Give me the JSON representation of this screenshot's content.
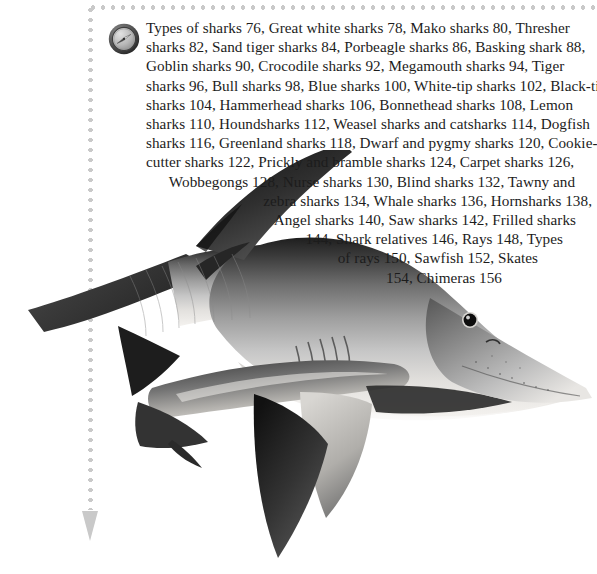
{
  "page": {
    "background_color": "#ffffff",
    "width": 597,
    "height": 574
  },
  "decor": {
    "dot_color": "#c9c9c9",
    "arrow_icon": "down-arrow-icon",
    "compass_icon": "compass-icon",
    "compass_outer_color": "#4a4a4a",
    "compass_face_color": "#bdbdbd"
  },
  "artwork": {
    "name": "shark-photograph",
    "subject": "blue shark",
    "palette": {
      "dark": "#2b2b2b",
      "mid": "#6e6e6e",
      "light": "#c8c8c8",
      "belly": "#eceae6",
      "eye": "#111111"
    }
  },
  "toc": {
    "title": "Types of sharks",
    "lines": [
      "Types of sharks 76, Great white sharks 78, Mako sharks 80, Thresher",
      "sharks 82, Sand tiger sharks 84, Porbeagle sharks 86, Basking shark 88,",
      "Goblin sharks 90, Crocodile sharks 92, Megamouth sharks 94, Tiger",
      "sharks 96, Bull sharks 98, Blue sharks 100, White-tip sharks 102, Black-tip",
      "sharks 104, Hammerhead sharks 106, Bonnethead sharks 108, Lemon",
      "sharks 110, Houndsharks 112, Weasel sharks and catsharks 114, Dogfish",
      "sharks 116, Greenland sharks 118, Dwarf and pygmy sharks 120, Cookie-",
      "cutter sharks 122, Prickly and bramble sharks 124, Carpet sharks 126,",
      "Wobbegongs 128, Nurse sharks 130, Blind sharks 132, Tawny and",
      "zebra sharks 134, Whale sharks 136, Hornsharks 138,",
      "Angel sharks 140, Saw sharks 142, Frilled sharks",
      "144, Shark relatives 146, Rays 148, Types",
      "of rays 150, Sawfish 152, Skates",
      "154, Chimeras 156"
    ],
    "entries": [
      {
        "label": "Types of sharks",
        "page": "76"
      },
      {
        "label": "Great white sharks",
        "page": "78"
      },
      {
        "label": "Mako sharks",
        "page": "80"
      },
      {
        "label": "Thresher sharks",
        "page": "82"
      },
      {
        "label": "Sand tiger sharks",
        "page": "84"
      },
      {
        "label": "Porbeagle sharks",
        "page": "86"
      },
      {
        "label": "Basking shark",
        "page": "88"
      },
      {
        "label": "Goblin sharks",
        "page": "90"
      },
      {
        "label": "Crocodile sharks",
        "page": "92"
      },
      {
        "label": "Megamouth sharks",
        "page": "94"
      },
      {
        "label": "Tiger sharks",
        "page": "96"
      },
      {
        "label": "Bull sharks",
        "page": "98"
      },
      {
        "label": "Blue sharks",
        "page": "100"
      },
      {
        "label": "White-tip sharks",
        "page": "102"
      },
      {
        "label": "Black-tip sharks",
        "page": "104"
      },
      {
        "label": "Hammerhead sharks",
        "page": "106"
      },
      {
        "label": "Bonnethead sharks",
        "page": "108"
      },
      {
        "label": "Lemon sharks",
        "page": "110"
      },
      {
        "label": "Houndsharks",
        "page": "112"
      },
      {
        "label": "Weasel sharks and catsharks",
        "page": "114"
      },
      {
        "label": "Dogfish sharks",
        "page": "116"
      },
      {
        "label": "Greenland sharks",
        "page": "118"
      },
      {
        "label": "Dwarf and pygmy sharks",
        "page": "120"
      },
      {
        "label": "Cookie-cutter sharks",
        "page": "122"
      },
      {
        "label": "Prickly and bramble sharks",
        "page": "124"
      },
      {
        "label": "Carpet sharks",
        "page": "126"
      },
      {
        "label": "Wobbegongs",
        "page": "128"
      },
      {
        "label": "Nurse sharks",
        "page": "130"
      },
      {
        "label": "Blind sharks",
        "page": "132"
      },
      {
        "label": "Tawny and zebra sharks",
        "page": "134"
      },
      {
        "label": "Whale sharks",
        "page": "136"
      },
      {
        "label": "Hornsharks",
        "page": "138"
      },
      {
        "label": "Angel sharks",
        "page": "140"
      },
      {
        "label": "Saw sharks",
        "page": "142"
      },
      {
        "label": "Frilled sharks",
        "page": "144"
      },
      {
        "label": "Shark relatives",
        "page": "146"
      },
      {
        "label": "Rays",
        "page": "148"
      },
      {
        "label": "Types of rays",
        "page": "150"
      },
      {
        "label": "Sawfish",
        "page": "152"
      },
      {
        "label": "Skates",
        "page": "154"
      },
      {
        "label": "Chimeras",
        "page": "156"
      }
    ]
  }
}
